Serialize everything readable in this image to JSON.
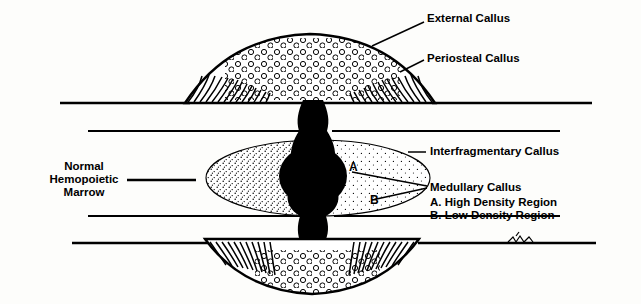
{
  "figure": {
    "background_color": "#fdfdfb",
    "ink_color": "#000000"
  },
  "labels": {
    "external_callus": "External Callus",
    "periosteal_callus": "Periosteal Callus",
    "interfragmentary_callus": "Interfragmentary Callus",
    "medullary_callus": "Medullary Callus",
    "legend_a": "A. High Density Region",
    "legend_b": "B. Low Density Region",
    "normal_marrow": "Normal\nHemopoietic\nMarrow",
    "normal_marrow_line1": "Normal",
    "normal_marrow_line2": "Hemopoietic",
    "normal_marrow_line3": "Marrow",
    "marker_a": "A",
    "marker_b": "B"
  },
  "regions": [
    {
      "name": "external-callus",
      "description": "Stippled circular-cell dome above the cortex"
    },
    {
      "name": "periosteal-callus",
      "description": "Hatched spiculated zone flanking the dome"
    },
    {
      "name": "interfragmentary-callus",
      "description": "Dark fracture gap column between cortices"
    },
    {
      "name": "medullary-callus",
      "description": "Stippled oval filling the marrow cavity"
    },
    {
      "name": "high-density-region",
      "description": "Dark dense core marked A"
    },
    {
      "name": "low-density-region",
      "description": "Lighter stipple marked B"
    },
    {
      "name": "normal-hemopoietic-marrow",
      "description": "Unfilled marrow cavity at left"
    }
  ]
}
